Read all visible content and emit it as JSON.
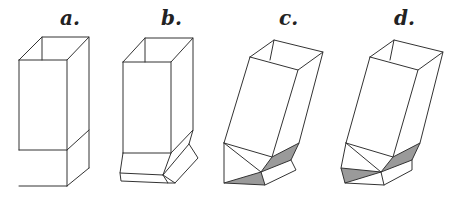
{
  "figure": {
    "panels": [
      {
        "id": "a",
        "label": "a."
      },
      {
        "id": "b",
        "label": "b."
      },
      {
        "id": "c",
        "label": "c."
      },
      {
        "id": "d",
        "label": "d."
      }
    ],
    "colors": {
      "stroke": "#333333",
      "shade": "#9a9a9a",
      "background": "#ffffff"
    }
  }
}
